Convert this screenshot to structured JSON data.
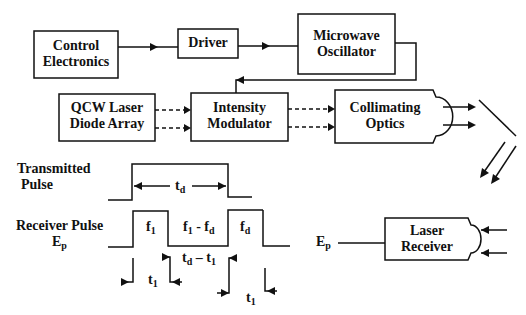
{
  "blocks": {
    "control_electronics": {
      "line1": "Control",
      "line2": "Electronics"
    },
    "driver": {
      "label": "Driver"
    },
    "microwave_oscillator": {
      "line1": "Microwave",
      "line2": "Oscillator"
    },
    "qcw_laser": {
      "line1": "QCW Laser",
      "line2": "Diode Array"
    },
    "intensity_modulator": {
      "line1": "Intensity",
      "line2": "Modulator"
    },
    "collimating_optics": {
      "line1": "Collimating",
      "line2": "Optics"
    },
    "laser_receiver": {
      "line1": "Laser",
      "line2": "Receiver"
    }
  },
  "timing": {
    "transmitted_label_1": "Transmitted",
    "transmitted_label_2": "Pulse",
    "td": "t",
    "td_sub": "d",
    "receiver_label_1": "Receiver Pulse",
    "receiver_label_2": "E",
    "receiver_label_2_sub": "p",
    "f1": "f",
    "f1_sub": "1",
    "f1_minus_fd": "f",
    "f1_minus_fd_sub1": "1",
    "f1_minus_fd_mid": " - f",
    "f1_minus_fd_sub2": "d",
    "fd": "f",
    "fd_sub": "d",
    "td_minus_t1": "t",
    "td_minus_t1_sub1": "d",
    "td_minus_t1_mid": " – t",
    "td_minus_t1_sub2": "1",
    "t1_a": "t",
    "t1_a_sub": "1",
    "t1_b": "t",
    "t1_b_sub": "1"
  },
  "receiver_input": {
    "label": "E",
    "label_sub": "p"
  },
  "colors": {
    "line": "#111111",
    "background": "#ffffff"
  }
}
